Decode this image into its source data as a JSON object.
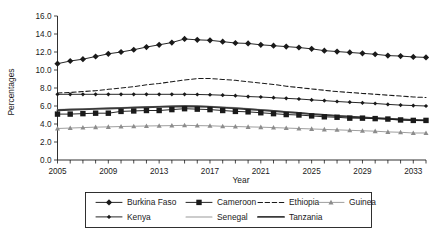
{
  "chart_data": {
    "type": "line",
    "title": "",
    "xlabel": "Year",
    "ylabel": "Percentages",
    "xlim": [
      2005,
      2034
    ],
    "ylim": [
      0.0,
      16.0
    ],
    "ytick_values": [
      0.0,
      2.0,
      4.0,
      6.0,
      8.0,
      10.0,
      12.0,
      14.0,
      16.0
    ],
    "ytick_labels": [
      "0.0",
      "2.0",
      "4.0",
      "6.0",
      "8.0",
      "10.0",
      "12.0",
      "14.0",
      "16.0"
    ],
    "xtick_values": [
      2005,
      2006,
      2007,
      2008,
      2009,
      2010,
      2011,
      2012,
      2013,
      2014,
      2015,
      2016,
      2017,
      2018,
      2019,
      2020,
      2021,
      2022,
      2023,
      2024,
      2025,
      2026,
      2027,
      2028,
      2029,
      2030,
      2031,
      2032,
      2033,
      2034
    ],
    "xtick_labels_shown": [
      "2005",
      "2009",
      "2013",
      "2017",
      "2021",
      "2025",
      "2029",
      "2033"
    ],
    "xtick_labels_values": [
      2005,
      2009,
      2013,
      2017,
      2021,
      2025,
      2029,
      2033
    ],
    "grid": false,
    "legend_position": "bottom",
    "x": [
      2005,
      2006,
      2007,
      2008,
      2009,
      2010,
      2011,
      2012,
      2013,
      2014,
      2015,
      2016,
      2017,
      2018,
      2019,
      2020,
      2021,
      2022,
      2023,
      2024,
      2025,
      2026,
      2027,
      2028,
      2029,
      2030,
      2031,
      2032,
      2033,
      2034
    ],
    "series": [
      {
        "name": "Burkina Faso",
        "marker": "diamond",
        "style": "solid",
        "color": "#1a1a1a",
        "values": [
          10.7,
          11.0,
          11.2,
          11.5,
          11.8,
          12.0,
          12.25,
          12.55,
          12.8,
          13.05,
          13.45,
          13.35,
          13.3,
          13.15,
          13.0,
          12.95,
          12.8,
          12.7,
          12.6,
          12.5,
          12.35,
          12.15,
          12.05,
          11.95,
          11.85,
          11.75,
          11.6,
          11.55,
          11.45,
          11.4
        ]
      },
      {
        "name": "Cameroon",
        "marker": "square",
        "style": "solid",
        "color": "#1a1a1a",
        "values": [
          5.1,
          5.1,
          5.15,
          5.2,
          5.2,
          5.4,
          5.45,
          5.5,
          5.5,
          5.6,
          5.7,
          5.65,
          5.6,
          5.5,
          5.4,
          5.35,
          5.25,
          5.15,
          5.05,
          5.0,
          4.9,
          4.8,
          4.75,
          4.65,
          4.65,
          4.6,
          4.55,
          4.45,
          4.4,
          4.4
        ]
      },
      {
        "name": "Ethiopia",
        "marker": "none",
        "style": "dashed",
        "color": "#1a1a1a",
        "values": [
          7.45,
          7.5,
          7.6,
          7.7,
          7.85,
          8.0,
          8.15,
          8.35,
          8.5,
          8.7,
          8.9,
          9.05,
          9.05,
          8.95,
          8.85,
          8.7,
          8.55,
          8.4,
          8.2,
          8.05,
          7.9,
          7.75,
          7.6,
          7.5,
          7.4,
          7.3,
          7.2,
          7.1,
          7.0,
          6.95
        ]
      },
      {
        "name": "Guinea",
        "marker": "triangle",
        "style": "solid-light",
        "color": "#8c8c8c",
        "values": [
          3.5,
          3.55,
          3.6,
          3.65,
          3.68,
          3.72,
          3.75,
          3.78,
          3.8,
          3.82,
          3.85,
          3.82,
          3.8,
          3.75,
          3.72,
          3.68,
          3.65,
          3.6,
          3.55,
          3.5,
          3.45,
          3.4,
          3.35,
          3.3,
          3.25,
          3.2,
          3.12,
          3.08,
          3.0,
          3.0
        ]
      },
      {
        "name": "Kenya",
        "marker": "small-diamond",
        "style": "solid",
        "color": "#1a1a1a",
        "values": [
          7.3,
          7.3,
          7.3,
          7.3,
          7.3,
          7.3,
          7.3,
          7.3,
          7.3,
          7.3,
          7.3,
          7.28,
          7.25,
          7.2,
          7.15,
          7.05,
          7.0,
          6.92,
          6.85,
          6.78,
          6.68,
          6.6,
          6.5,
          6.42,
          6.35,
          6.28,
          6.18,
          6.1,
          6.05,
          6.0
        ]
      },
      {
        "name": "Senegal",
        "marker": "none",
        "style": "thin-light",
        "color": "#9a9a9a",
        "values": [
          5.62,
          5.66,
          5.7,
          5.74,
          5.78,
          5.82,
          5.88,
          5.92,
          5.96,
          6.0,
          6.05,
          6.02,
          5.98,
          5.9,
          5.82,
          5.72,
          5.6,
          5.5,
          5.38,
          5.28,
          5.15,
          5.05,
          4.95,
          4.85,
          4.75,
          4.68,
          4.6,
          4.55,
          4.48,
          4.45
        ]
      },
      {
        "name": "Tanzania",
        "marker": "none",
        "style": "thick",
        "color": "#3a3a3a",
        "values": [
          5.52,
          5.58,
          5.62,
          5.68,
          5.72,
          5.76,
          5.82,
          5.86,
          5.9,
          5.94,
          5.98,
          5.95,
          5.9,
          5.82,
          5.74,
          5.64,
          5.54,
          5.44,
          5.32,
          5.22,
          5.1,
          5.0,
          4.9,
          4.8,
          4.72,
          4.65,
          4.58,
          4.5,
          4.44,
          4.4
        ]
      }
    ]
  },
  "legend": {
    "row1": [
      "Burkina Faso",
      "Cameroon",
      "Ethiopia",
      "Guinea"
    ],
    "row2": [
      "Kenya",
      "Senegal",
      "Tanzania"
    ]
  },
  "colors": {
    "axis": "#1a1a1a",
    "text": "#1a1a1a",
    "background": "#ffffff",
    "light_series": "#8c8c8c"
  }
}
